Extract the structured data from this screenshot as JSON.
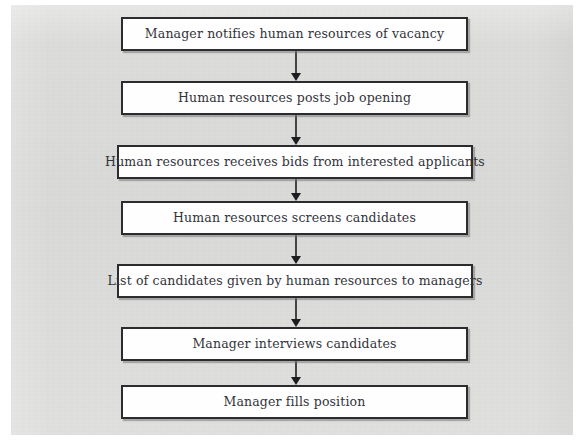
{
  "diagram": {
    "type": "flowchart",
    "orientation": "top-to-bottom",
    "page_background": "#dcdcdb",
    "node_fill": "#fefefe",
    "node_border_color": "#2c2c2e",
    "connector_color": "#1d1d1f",
    "nodes": [
      {
        "id": "n1",
        "label": "Manager notifies human resources of vacancy",
        "x": 121,
        "y": 17,
        "width": 347,
        "height": 34
      },
      {
        "id": "n2",
        "label": "Human resources posts job opening",
        "x": 121,
        "y": 81,
        "width": 347,
        "height": 34
      },
      {
        "id": "n3",
        "label": "Human resources receives bids from interested applicants",
        "x": 117,
        "y": 145,
        "width": 356,
        "height": 34
      },
      {
        "id": "n4",
        "label": "Human resources screens candidates",
        "x": 121,
        "y": 201,
        "width": 347,
        "height": 34
      },
      {
        "id": "n5",
        "label": "List of candidates given by human resources to managers",
        "x": 117,
        "y": 264,
        "width": 356,
        "height": 34
      },
      {
        "id": "n6",
        "label": "Manager interviews candidates",
        "x": 121,
        "y": 327,
        "width": 347,
        "height": 34
      },
      {
        "id": "n7",
        "label": "Manager fills position",
        "x": 121,
        "y": 385,
        "width": 347,
        "height": 34
      }
    ],
    "connectors": [
      {
        "id": "c1",
        "from": "n1",
        "to": "n2",
        "x": 289,
        "y": 51,
        "length": 30
      },
      {
        "id": "c2",
        "from": "n2",
        "to": "n3",
        "x": 289,
        "y": 115,
        "length": 30
      },
      {
        "id": "c3",
        "from": "n3",
        "to": "n4",
        "x": 289,
        "y": 179,
        "length": 22
      },
      {
        "id": "c4",
        "from": "n4",
        "to": "n5",
        "x": 289,
        "y": 235,
        "length": 29
      },
      {
        "id": "c5",
        "from": "n5",
        "to": "n6",
        "x": 289,
        "y": 298,
        "length": 29
      },
      {
        "id": "c6",
        "from": "n6",
        "to": "n7",
        "x": 289,
        "y": 361,
        "length": 24
      }
    ]
  }
}
